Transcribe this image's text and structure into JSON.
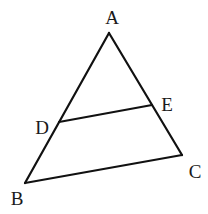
{
  "diagram": {
    "type": "triangle-with-parallel-segment",
    "stroke_color": "#111111",
    "background": "#ffffff",
    "points": {
      "A": {
        "label": "A",
        "x": 109,
        "y": 33,
        "label_x": 112,
        "label_y": 24
      },
      "B": {
        "label": "B",
        "x": 25,
        "y": 183,
        "label_x": 17,
        "label_y": 205
      },
      "C": {
        "label": "C",
        "x": 182,
        "y": 155,
        "label_x": 195,
        "label_y": 178
      },
      "D": {
        "label": "D",
        "x": 59,
        "y": 122,
        "label_x": 42,
        "label_y": 134
      },
      "E": {
        "label": "E",
        "x": 152,
        "y": 105,
        "label_x": 167,
        "label_y": 111
      }
    },
    "segments": [
      {
        "from": "A",
        "to": "B"
      },
      {
        "from": "A",
        "to": "C"
      },
      {
        "from": "B",
        "to": "C"
      },
      {
        "from": "D",
        "to": "E"
      }
    ]
  }
}
